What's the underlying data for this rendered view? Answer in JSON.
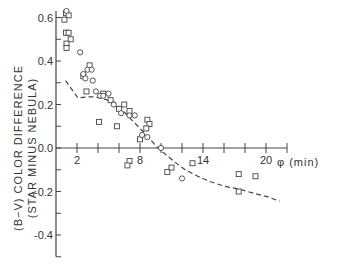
{
  "chart_data": {
    "type": "scatter",
    "title": "",
    "xlabel": "φ (min)",
    "ylabel": "(B−V) COLOR DIFFERENCE",
    "ylabel_sub": "(STAR MINUS NEBULA)",
    "xlim": [
      0,
      22
    ],
    "ylim": [
      -0.5,
      0.63
    ],
    "grid": false,
    "legend": "none",
    "x_ticks": [
      2,
      4,
      6,
      8,
      10,
      12,
      14,
      16,
      18,
      20,
      22
    ],
    "x_tick_labels": [
      {
        "value": 2,
        "label": "2"
      },
      {
        "value": 8,
        "label": "8"
      },
      {
        "value": 14,
        "label": "14"
      },
      {
        "value": 20,
        "label": "20"
      }
    ],
    "y_ticks": [
      0.6,
      0.5,
      0.4,
      0.3,
      0.2,
      0.1,
      0.0,
      -0.1,
      -0.2,
      -0.3,
      -0.4,
      -0.5
    ],
    "y_tick_labels": [
      {
        "value": 0.6,
        "label": "0.6"
      },
      {
        "value": 0.4,
        "label": "0.4"
      },
      {
        "value": 0.2,
        "label": "0.2"
      },
      {
        "value": 0.0,
        "label": "0.0"
      },
      {
        "value": -0.2,
        "label": "-0.2"
      },
      {
        "value": -0.4,
        "label": "-0.4"
      }
    ],
    "series": [
      {
        "name": "squares",
        "marker": "square",
        "points": [
          [
            0.95,
            0.62
          ],
          [
            1.2,
            0.61
          ],
          [
            0.8,
            0.59
          ],
          [
            0.95,
            0.53
          ],
          [
            1.2,
            0.53
          ],
          [
            1.4,
            0.5
          ],
          [
            1.0,
            0.48
          ],
          [
            1.0,
            0.46
          ],
          [
            3.2,
            0.38
          ],
          [
            2.6,
            0.33
          ],
          [
            2.9,
            0.26
          ],
          [
            6.5,
            0.2
          ],
          [
            4.1,
            0.12
          ],
          [
            5.8,
            0.1
          ],
          [
            4.5,
            0.25
          ],
          [
            5.2,
            0.22
          ],
          [
            6.0,
            0.18
          ],
          [
            7.0,
            0.17
          ],
          [
            8.7,
            0.13
          ],
          [
            8.9,
            0.11
          ],
          [
            8.6,
            0.09
          ],
          [
            8.0,
            0.04
          ],
          [
            7.0,
            -0.06
          ],
          [
            6.8,
            -0.08
          ],
          [
            10.6,
            -0.11
          ],
          [
            11.0,
            -0.09
          ],
          [
            13.0,
            -0.07
          ],
          [
            17.4,
            -0.12
          ],
          [
            19.0,
            -0.13
          ],
          [
            17.4,
            -0.2
          ]
        ]
      },
      {
        "name": "circles",
        "marker": "circle",
        "points": [
          [
            1.0,
            0.63
          ],
          [
            2.3,
            0.44
          ],
          [
            3.0,
            0.36
          ],
          [
            3.4,
            0.36
          ],
          [
            2.6,
            0.34
          ],
          [
            2.8,
            0.32
          ],
          [
            3.5,
            0.31
          ],
          [
            3.8,
            0.26
          ],
          [
            4.2,
            0.24
          ],
          [
            4.5,
            0.24
          ],
          [
            5.0,
            0.25
          ],
          [
            5.5,
            0.2
          ],
          [
            6.2,
            0.16
          ],
          [
            7.0,
            0.15
          ],
          [
            7.5,
            0.15
          ],
          [
            8.7,
            0.05
          ],
          [
            8.2,
            0.06
          ],
          [
            10.0,
            0.0
          ],
          [
            12.0,
            -0.14
          ]
        ]
      },
      {
        "name": "fit",
        "marker": "dashed-line",
        "points": [
          [
            0.9,
            0.31
          ],
          [
            2.1,
            0.23
          ],
          [
            3.0,
            0.235
          ],
          [
            3.7,
            0.235
          ],
          [
            4.6,
            0.225
          ],
          [
            5.6,
            0.21
          ],
          [
            6.6,
            0.16
          ],
          [
            7.3,
            0.125
          ],
          [
            8.0,
            0.09
          ],
          [
            8.8,
            0.05
          ],
          [
            9.5,
            0.01
          ],
          [
            10.2,
            -0.02
          ],
          [
            11.2,
            -0.06
          ],
          [
            12.3,
            -0.1
          ],
          [
            13.5,
            -0.13
          ],
          [
            14.7,
            -0.155
          ],
          [
            16.0,
            -0.175
          ],
          [
            17.5,
            -0.19
          ],
          [
            19.0,
            -0.21
          ],
          [
            20.2,
            -0.225
          ],
          [
            21.3,
            -0.245
          ]
        ]
      }
    ]
  },
  "axes": {
    "x_title": "φ (min)",
    "y_title_line1": "(B−V) COLOR DIFFERENCE",
    "y_title_line2": "(STAR MINUS NEBULA)"
  },
  "colors": {
    "ink": "#444444",
    "background": "#ffffff"
  }
}
